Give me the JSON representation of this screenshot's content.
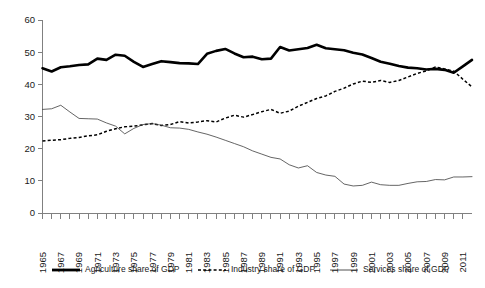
{
  "chart_data": {
    "type": "line",
    "title": "",
    "subtitle": "",
    "xlabel": "",
    "ylabel": "",
    "ylim": [
      0,
      60
    ],
    "ytick_values": [
      0,
      10,
      20,
      30,
      40,
      50,
      60
    ],
    "ytick_labels": [
      "0",
      "10",
      "20",
      "30",
      "40",
      "50",
      "60"
    ],
    "xlim": [
      1965,
      2012
    ],
    "xtick_labels": [
      "1965",
      "1967",
      "1969",
      "1971",
      "1973",
      "1975",
      "1977",
      "1979",
      "1981",
      "1983",
      "1985",
      "1987",
      "1989",
      "1991",
      "1993",
      "1995",
      "1997",
      "1999",
      "2001",
      "2003",
      "2005",
      "2007",
      "2009",
      "2011"
    ],
    "grid": false,
    "legend_position": "bottom",
    "x": [
      1965,
      1966,
      1967,
      1968,
      1969,
      1970,
      1971,
      1972,
      1973,
      1974,
      1975,
      1976,
      1977,
      1978,
      1979,
      1980,
      1981,
      1982,
      1983,
      1984,
      1985,
      1986,
      1987,
      1988,
      1989,
      1990,
      1991,
      1992,
      1993,
      1994,
      1995,
      1996,
      1997,
      1998,
      1999,
      2000,
      2001,
      2002,
      2003,
      2004,
      2005,
      2006,
      2007,
      2008,
      2009,
      2010,
      2011,
      2012
    ],
    "series": [
      {
        "name": "Agriculture share of GDP",
        "style": "thick-solid",
        "color": "#000000",
        "values": [
          45.0,
          44.0,
          45.3,
          45.6,
          46.0,
          46.2,
          48.0,
          47.6,
          49.2,
          48.9,
          47.0,
          45.4,
          46.3,
          47.2,
          46.9,
          46.6,
          46.5,
          46.3,
          49.5,
          50.4,
          51.0,
          49.6,
          48.4,
          48.6,
          47.8,
          48.0,
          51.6,
          50.5,
          50.9,
          51.3,
          52.3,
          51.2,
          50.9,
          50.6,
          49.8,
          49.3,
          48.2,
          47.0,
          46.4,
          45.7,
          45.2,
          45.0,
          44.6,
          44.8,
          44.5,
          43.6,
          45.6,
          47.6
        ]
      },
      {
        "name": "Industry share of GDP",
        "style": "dotted",
        "color": "#000000",
        "values": [
          22.4,
          22.6,
          22.8,
          23.2,
          23.5,
          24.0,
          24.3,
          25.4,
          26.2,
          26.8,
          27.0,
          27.4,
          27.8,
          27.2,
          27.5,
          28.4,
          28.0,
          28.3,
          28.7,
          28.3,
          29.5,
          30.4,
          29.8,
          30.6,
          31.5,
          32.2,
          31.0,
          31.7,
          33.2,
          34.4,
          35.6,
          36.4,
          37.8,
          38.8,
          40.1,
          41.0,
          40.6,
          41.2,
          40.6,
          41.2,
          42.3,
          43.4,
          44.2,
          45.4,
          44.8,
          44.1,
          41.6,
          39.2
        ]
      },
      {
        "name": "Services share of GDP",
        "style": "thin-solid",
        "color": "#3d3d3d",
        "values": [
          32.2,
          32.4,
          33.5,
          31.4,
          29.4,
          29.3,
          29.2,
          28.0,
          27.0,
          24.6,
          26.3,
          27.5,
          27.8,
          27.3,
          26.5,
          26.4,
          26.0,
          25.2,
          24.5,
          23.6,
          22.6,
          21.6,
          20.6,
          19.3,
          18.3,
          17.3,
          16.8,
          15.0,
          14.0,
          14.7,
          12.6,
          11.8,
          11.4,
          9.0,
          8.4,
          8.6,
          9.6,
          8.8,
          8.6,
          8.6,
          9.2,
          9.7,
          9.8,
          10.4,
          10.3,
          11.2,
          11.2,
          11.3
        ]
      }
    ],
    "legend": [
      {
        "label": "Agriculture share of GDP",
        "style": "thick-solid"
      },
      {
        "label": "Industry share of GDP",
        "style": "dotted"
      },
      {
        "label": "Services share of GDP",
        "style": "thin-solid"
      }
    ]
  }
}
